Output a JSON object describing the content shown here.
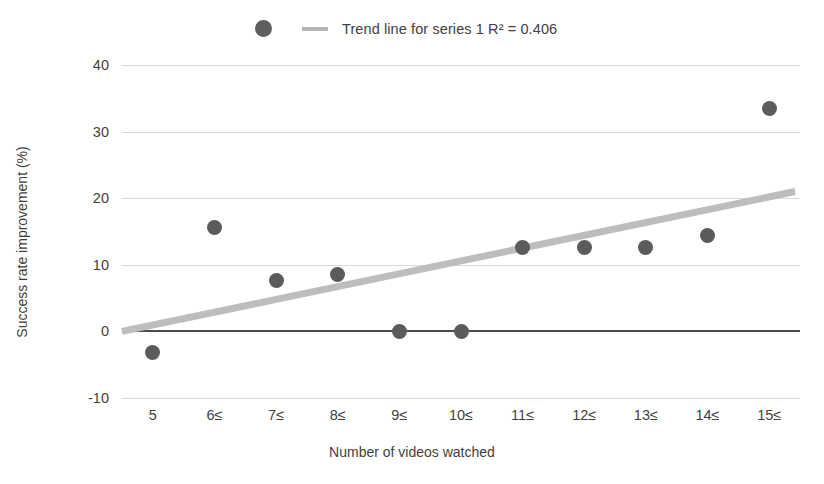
{
  "chart_data": {
    "type": "scatter",
    "title": "",
    "xlabel": "Number of videos watched",
    "ylabel": "Success rate improvement (%)",
    "categories": [
      "5",
      "6≤",
      "7≤",
      "8≤",
      "9≤",
      "10≤",
      "11≤",
      "12≤",
      "13≤",
      "14≤",
      "15≤"
    ],
    "values": [
      -3.1,
      15.6,
      7.7,
      8.5,
      0.0,
      0.0,
      12.6,
      12.6,
      12.6,
      14.4,
      33.4
    ],
    "series": [
      {
        "name": "series 1",
        "values": [
          -3.1,
          15.6,
          7.7,
          8.5,
          0.0,
          0.0,
          12.6,
          12.6,
          12.6,
          14.4,
          33.4
        ]
      }
    ],
    "trendline": {
      "label": "Trend line for series 1 R² = 0.406",
      "r_squared": 0.406,
      "start": {
        "x_index": 0,
        "y": 0.0
      },
      "end": {
        "x_index": 10,
        "y": 21.0
      }
    },
    "ylim": [
      -10,
      40
    ],
    "yticks": [
      40,
      30,
      20,
      10,
      0,
      -10
    ],
    "ytick_labels": [
      "40",
      "30",
      "20",
      "10",
      "0",
      "-10"
    ],
    "grid": true,
    "legend_position": "top-center"
  },
  "legend": {
    "marker_name": "series-1-marker",
    "line_name": "trend-line-swatch",
    "text": "Trend line for series 1 R² = 0.406"
  },
  "colors": {
    "point": "#5b5b5b",
    "trendline": "#bdbdbd",
    "gridline": "#d9d9d9",
    "zeroline": "#4a4a4a",
    "text": "#3f3f3f",
    "background": "#ffffff"
  }
}
